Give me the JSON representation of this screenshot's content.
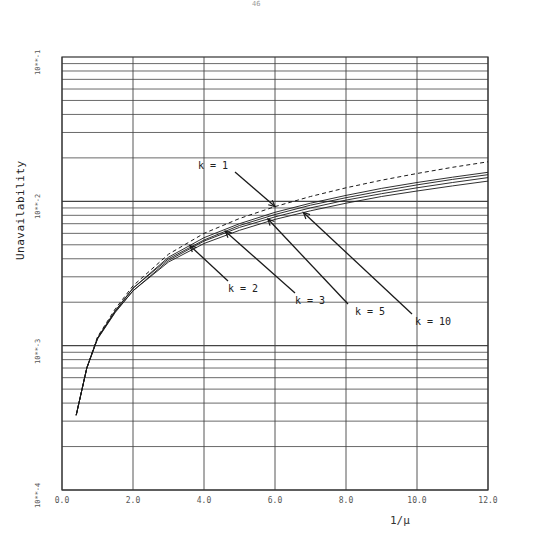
{
  "page": {
    "number": "46"
  },
  "chart_data": {
    "type": "line",
    "title": "",
    "xlabel": "1/μ",
    "ylabel": "Unavailability",
    "xlim": [
      0,
      12
    ],
    "ylim": [
      0.0001,
      0.1
    ],
    "yscale": "log",
    "grid": true,
    "x_ticks": [
      "0.0",
      "2.0",
      "4.0",
      "6.0",
      "8.0",
      "10.0",
      "12.0"
    ],
    "y_ticks": [
      "10**-4",
      "10**-3",
      "10**-2",
      "10**-1"
    ],
    "x": [
      0.4,
      0.7,
      1.0,
      1.5,
      2.0,
      3.0,
      4.0,
      5.0,
      6.0,
      7.0,
      8.0,
      9.0,
      10.0,
      11.0,
      12.0
    ],
    "series": [
      {
        "name": "k = 1",
        "style": "dashed",
        "values": [
          0.00033,
          0.0007,
          0.00115,
          0.0018,
          0.0026,
          0.0043,
          0.006,
          0.0076,
          0.0092,
          0.0108,
          0.0124,
          0.014,
          0.0156,
          0.0172,
          0.0188
        ]
      },
      {
        "name": "k = 2",
        "style": "solid",
        "values": [
          0.00033,
          0.0007,
          0.00113,
          0.00175,
          0.0025,
          0.0041,
          0.0056,
          0.007,
          0.0084,
          0.0097,
          0.011,
          0.0123,
          0.0135,
          0.0147,
          0.0159
        ]
      },
      {
        "name": "k = 3",
        "style": "solid",
        "values": [
          0.00033,
          0.0007,
          0.00113,
          0.00174,
          0.0025,
          0.004,
          0.0054,
          0.0068,
          0.0081,
          0.0094,
          0.0106,
          0.0118,
          0.013,
          0.0142,
          0.0153
        ]
      },
      {
        "name": "k = 5",
        "style": "solid",
        "values": [
          0.00033,
          0.0007,
          0.00112,
          0.00172,
          0.0024,
          0.0039,
          0.0053,
          0.0066,
          0.0078,
          0.009,
          0.0102,
          0.0113,
          0.0124,
          0.0135,
          0.0146
        ]
      },
      {
        "name": "k = 10",
        "style": "solid",
        "values": [
          0.00033,
          0.0007,
          0.00111,
          0.0017,
          0.0024,
          0.0038,
          0.0051,
          0.0063,
          0.0075,
          0.0086,
          0.0097,
          0.0108,
          0.0118,
          0.0128,
          0.0138
        ]
      }
    ],
    "annotations": [
      {
        "text": "k = 1",
        "arrow_to_x": 6.0
      },
      {
        "text": "k = 2",
        "arrow_to_x": 3.6
      },
      {
        "text": "k = 3",
        "arrow_to_x": 4.5
      },
      {
        "text": "k = 5",
        "arrow_to_x": 5.8
      },
      {
        "text": "k = 10",
        "arrow_to_x": 6.8
      }
    ],
    "legend": "none (inline arrow annotations)"
  },
  "labels": {
    "k1": "k = 1",
    "k2": "k = 2",
    "k3": "k = 3",
    "k5": "k = 5",
    "k10": "k = 10"
  }
}
